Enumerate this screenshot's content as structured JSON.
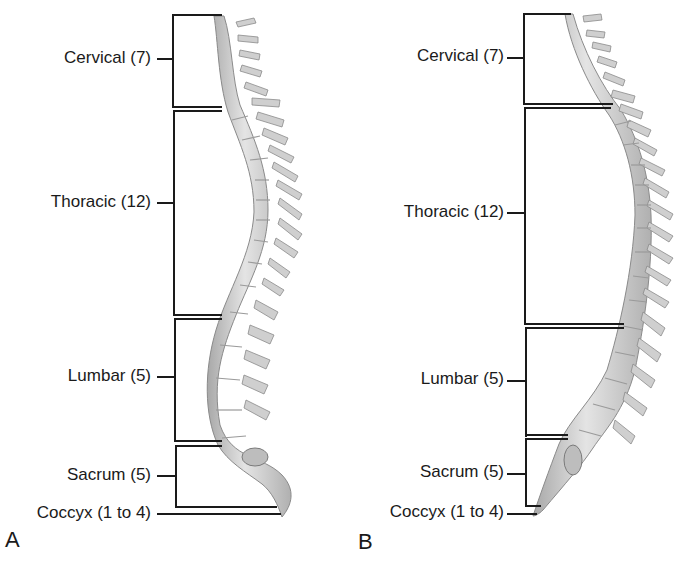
{
  "figure": {
    "panels": [
      {
        "id": "A",
        "letter": "A",
        "view": "normal curvature",
        "regions": [
          {
            "label": "Cervical (7)",
            "name": "Cervical",
            "count": "7"
          },
          {
            "label": "Thoracic (12)",
            "name": "Thoracic",
            "count": "12"
          },
          {
            "label": "Lumbar (5)",
            "name": "Lumbar",
            "count": "5"
          },
          {
            "label": "Sacrum (5)",
            "name": "Sacrum",
            "count": "5"
          },
          {
            "label": "Coccyx (1 to 4)",
            "name": "Coccyx",
            "count": "1 to 4"
          }
        ]
      },
      {
        "id": "B",
        "letter": "B",
        "view": "flattened curvature",
        "regions": [
          {
            "label": "Cervical (7)",
            "name": "Cervical",
            "count": "7"
          },
          {
            "label": "Thoracic (12)",
            "name": "Thoracic",
            "count": "12"
          },
          {
            "label": "Lumbar (5)",
            "name": "Lumbar",
            "count": "5"
          },
          {
            "label": "Sacrum (5)",
            "name": "Sacrum",
            "count": "5"
          },
          {
            "label": "Coccyx (1 to 4)",
            "name": "Coccyx",
            "count": "1 to 4"
          }
        ]
      }
    ],
    "colors": {
      "bone_fill": "#d6d6d6",
      "bone_shadow": "#9a9a9a",
      "line": "#1a1a1a",
      "text": "#1a1a1a"
    }
  }
}
